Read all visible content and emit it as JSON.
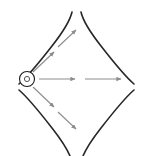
{
  "figure": {
    "title": "",
    "width": 152,
    "height": 156,
    "background_color": "#ffffff"
  },
  "colors": {
    "boundary_stroke": "#262626",
    "ray_stroke": "#8c8c8c",
    "source_stroke": "#1a1a1a",
    "source_fill": "#8c8c8c"
  },
  "source": {
    "label": "",
    "cx": 27,
    "cy": 79,
    "outer_radius": 7.5,
    "inner_radius": 2.6,
    "outer_stroke_width": 1.1,
    "inner_stroke_width": 1.0
  },
  "boundary": {
    "stroke_width": 1.6,
    "description": "four concave arcs forming a diamond/lens outline with gaps at top, bottom, left and right",
    "arcs": [
      {
        "name": "upper-left-arc",
        "path": "M 19 84 C 26 78 38 64 52 46 C 63 32 70 21 72 12"
      },
      {
        "name": "upper-right-arc",
        "path": "M 81 12 C 83 21 90 32 101 46 C 115 64 127 78 134 84"
      },
      {
        "name": "lower-right-arc",
        "path": "M 134 90 C 127 96 115 110 101 128 C 90 142 83 153 81 162"
      },
      {
        "name": "lower-left-arc",
        "path": "M 72 162 C 70 153 63 142 52 128 C 38 110 26 96 19 90"
      }
    ]
  },
  "rays": {
    "stroke_width": 1.1,
    "head_size": 4.0,
    "items": [
      {
        "name": "ray-horizontal-inner",
        "direction": "right",
        "x1": 39,
        "y1": 79,
        "x2": 75,
        "y2": 79
      },
      {
        "name": "ray-horizontal-outer",
        "direction": "right",
        "x1": 85,
        "y1": 79,
        "x2": 121,
        "y2": 79
      },
      {
        "name": "ray-upper-inner",
        "direction": "up-right",
        "x1": 33,
        "y1": 72,
        "x2": 54,
        "y2": 52
      },
      {
        "name": "ray-upper-outer",
        "direction": "up-right",
        "x1": 58,
        "y1": 47,
        "x2": 76,
        "y2": 30
      },
      {
        "name": "ray-lower-inner",
        "direction": "down-right",
        "x1": 33,
        "y1": 87,
        "x2": 54,
        "y2": 107
      },
      {
        "name": "ray-lower-outer",
        "direction": "down-right",
        "x1": 58,
        "y1": 112,
        "x2": 76,
        "y2": 129
      }
    ]
  }
}
